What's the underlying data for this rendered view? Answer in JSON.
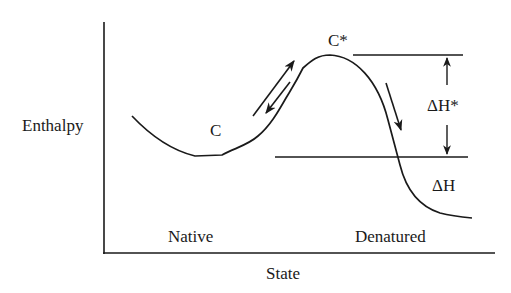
{
  "diagram": {
    "type": "energy-landscape",
    "axes": {
      "y_label": "Enthalpy",
      "x_label": "State"
    },
    "state_labels": {
      "native": "Native",
      "denatured": "Denatured"
    },
    "curve_points": {
      "native_conformation": "C",
      "transition_state": "C*"
    },
    "energy_differences": {
      "activation": "ΔH*",
      "reaction": "ΔH"
    },
    "colors": {
      "line": "#1a1a1a",
      "background": "#ffffff"
    }
  }
}
